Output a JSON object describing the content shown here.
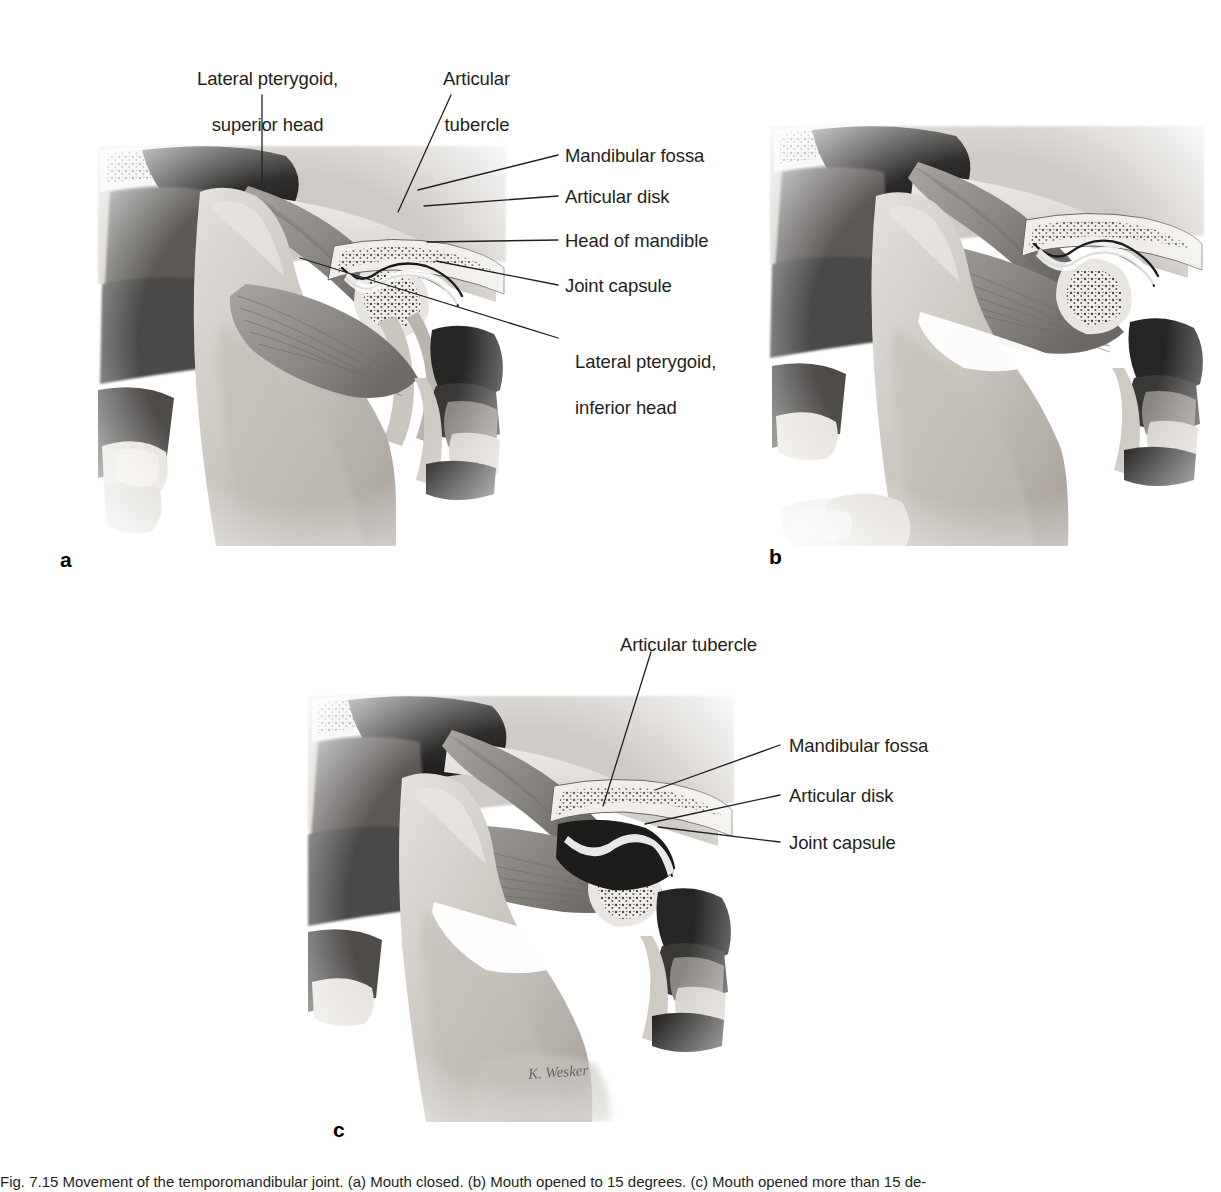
{
  "figure": {
    "number": "Fig. 7.15",
    "artist_signature": "K. Wesker",
    "caption_line1": "Fig. 7.15  Movement of the temporomandibular joint. (a) Mouth closed. (b) Mouth opened to 15 degrees. (c) Mouth opened more than 15 de-",
    "caption_line2": "grees."
  },
  "panels": [
    {
      "id": "a",
      "letter": "a",
      "title": "Mouth closed",
      "labels": [
        {
          "id": "lateral-pterygoid-superior-head",
          "lines": [
            "Lateral pterygoid,",
            "superior head"
          ],
          "align": "center",
          "side": "top-left"
        },
        {
          "id": "articular-tubercle",
          "lines": [
            "Articular",
            "tubercle"
          ],
          "align": "center",
          "side": "top-right"
        },
        {
          "id": "mandibular-fossa",
          "lines": [
            "Mandibular fossa"
          ],
          "align": "left",
          "side": "right"
        },
        {
          "id": "articular-disk",
          "lines": [
            "Articular disk"
          ],
          "align": "left",
          "side": "right"
        },
        {
          "id": "head-of-mandible",
          "lines": [
            "Head of mandible"
          ],
          "align": "left",
          "side": "right"
        },
        {
          "id": "joint-capsule",
          "lines": [
            "Joint capsule"
          ],
          "align": "left",
          "side": "right"
        },
        {
          "id": "lateral-pterygoid-inferior-head",
          "lines": [
            "Lateral pterygoid,",
            "inferior head"
          ],
          "align": "left",
          "side": "right"
        }
      ]
    },
    {
      "id": "b",
      "letter": "b",
      "title": "Mouth opened to 15 degrees",
      "labels": []
    },
    {
      "id": "c",
      "letter": "c",
      "title": "Mouth opened more than 15 degrees",
      "labels": [
        {
          "id": "articular-tubercle",
          "lines": [
            "Articular tubercle"
          ],
          "align": "left",
          "side": "top"
        },
        {
          "id": "mandibular-fossa",
          "lines": [
            "Mandibular fossa"
          ],
          "align": "left",
          "side": "right"
        },
        {
          "id": "articular-disk",
          "lines": [
            "Articular disk"
          ],
          "align": "left",
          "side": "right"
        },
        {
          "id": "joint-capsule",
          "lines": [
            "Joint capsule"
          ],
          "align": "left",
          "side": "right"
        }
      ]
    }
  ],
  "labels_text": {
    "a_lateral_pterygoid_superior_1": "Lateral pterygoid,",
    "a_lateral_pterygoid_superior_2": "superior head",
    "a_articular_tubercle_1": "Articular",
    "a_articular_tubercle_2": "tubercle",
    "a_mandibular_fossa": "Mandibular fossa",
    "a_articular_disk": "Articular disk",
    "a_head_of_mandible": "Head of mandible",
    "a_joint_capsule": "Joint capsule",
    "a_lateral_pterygoid_inferior_1": "Lateral pterygoid,",
    "a_lateral_pterygoid_inferior_2": "inferior head",
    "c_articular_tubercle": "Articular tubercle",
    "c_mandibular_fossa": "Mandibular fossa",
    "c_articular_disk": "Articular disk",
    "c_joint_capsule": "Joint capsule"
  },
  "letters": {
    "a": "a",
    "b": "b",
    "c": "c"
  },
  "colors": {
    "text": "#231f20",
    "leader": "#231f20",
    "background": "#ffffff",
    "bone_light": "#d9d5d0",
    "bone_mid": "#b3aea8",
    "muscle": "#8e8a86",
    "shadow_dark": "#3b3a38",
    "deep_black": "#1a1a1a"
  }
}
